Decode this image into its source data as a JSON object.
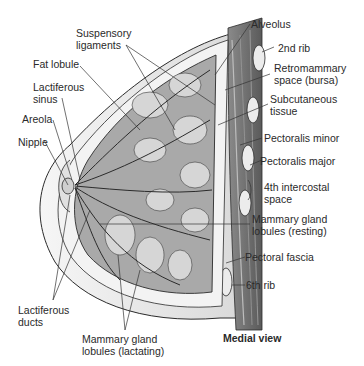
{
  "diagram": {
    "type": "anatomical-illustration",
    "caption": "Medial view",
    "labels_left": [
      {
        "id": "suspensory",
        "line1": "Suspensory",
        "line2": "ligaments"
      },
      {
        "id": "fat-lobule",
        "line1": "Fat lobule",
        "line2": ""
      },
      {
        "id": "lactiferous-sinus",
        "line1": "Lactiferous",
        "line2": "sinus"
      },
      {
        "id": "areola",
        "line1": "Areola",
        "line2": ""
      },
      {
        "id": "nipple",
        "line1": "Nipple",
        "line2": ""
      },
      {
        "id": "lactiferous-ducts",
        "line1": "Lactiferous",
        "line2": "ducts"
      },
      {
        "id": "lobules-lactating",
        "line1": "Mammary gland",
        "line2": "lobules (lactating)"
      }
    ],
    "labels_right": [
      {
        "id": "alveolus",
        "line1": "Alveolus",
        "line2": ""
      },
      {
        "id": "second-rib",
        "line1": "2nd rib",
        "line2": ""
      },
      {
        "id": "retromammary",
        "line1": "Retromammary",
        "line2": "space (bursa)"
      },
      {
        "id": "subcutaneous",
        "line1": "Subcutaneous",
        "line2": "tissue"
      },
      {
        "id": "pectoralis-minor",
        "line1": "Pectoralis minor",
        "line2": ""
      },
      {
        "id": "pectoralis-major",
        "line1": "Pectoralis major",
        "line2": ""
      },
      {
        "id": "intercostal",
        "line1": "4th intercostal",
        "line2": "space"
      },
      {
        "id": "lobules-resting",
        "line1": "Mammary gland",
        "line2": "lobules (resting)"
      },
      {
        "id": "pectoral-fascia",
        "line1": "Pectoral fascia",
        "line2": ""
      },
      {
        "id": "sixth-rib",
        "line1": "6th rib",
        "line2": ""
      }
    ],
    "colors": {
      "skin": "#ececec",
      "gland": "#a9a9a9",
      "fat": "#f4f4f4",
      "muscle": "#6e6e6e",
      "rib": "#e8e8e8",
      "outline": "#2b2b2b",
      "leader": "#333333"
    }
  }
}
